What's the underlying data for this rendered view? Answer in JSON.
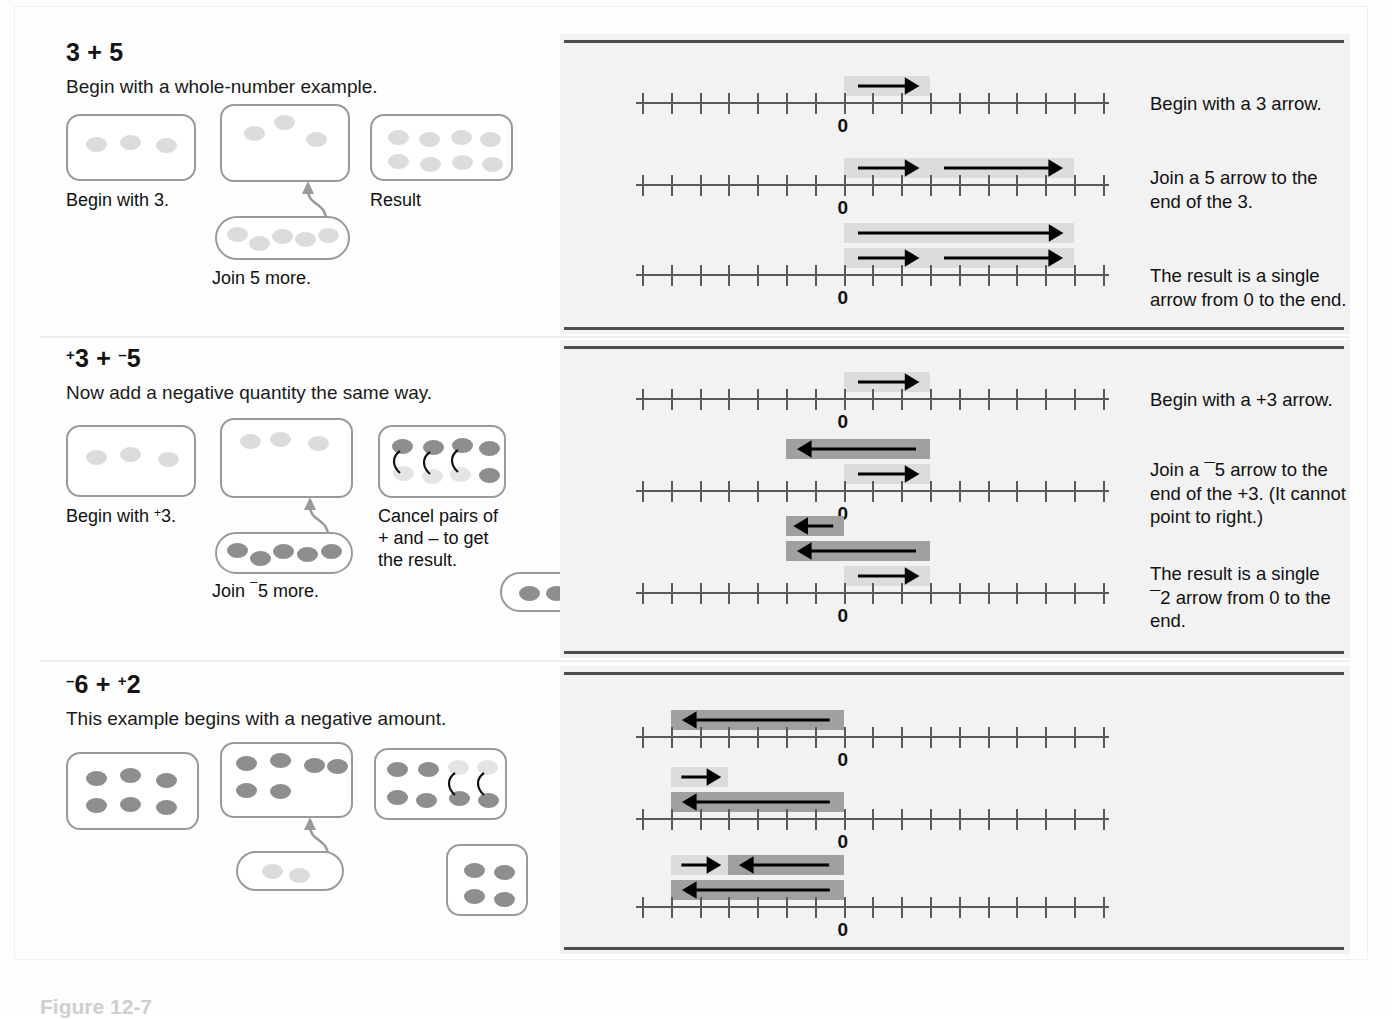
{
  "figure": {
    "caption": "Figure 12-7"
  },
  "panels": [
    {
      "id": "panel-whole-number",
      "equation_plain": "3 + 5",
      "equation_parts": [
        {
          "text": "3",
          "sign": ""
        },
        {
          "text": " + ",
          "sign": ""
        },
        {
          "text": "5",
          "sign": ""
        }
      ],
      "subtitle": "Begin with a whole-number example.",
      "dot_captions": {
        "begin": "Begin with 3.",
        "join": "Join 5 more.",
        "result": "Result"
      },
      "dot_counts": {
        "begin": 3,
        "join": 5,
        "result": 8
      },
      "lines": [
        {
          "note": "Begin with a 3 arrow.",
          "bars": [
            {
              "from": 0,
              "to": 3,
              "shade": "light",
              "dir": "right"
            }
          ]
        },
        {
          "note": "Join a 5 arrow to the\nend of the 3.",
          "bars": [
            {
              "from": 0,
              "to": 3,
              "shade": "light",
              "dir": "right"
            },
            {
              "from": 3,
              "to": 8,
              "shade": "light",
              "dir": "right"
            }
          ]
        },
        {
          "note": "The result is a single\narrow from 0 to the end.",
          "bars": [
            {
              "from": 0,
              "to": 8,
              "shade": "light",
              "dir": "right",
              "row": 0
            },
            {
              "from": 0,
              "to": 3,
              "shade": "light",
              "dir": "right",
              "row": 1
            },
            {
              "from": 3,
              "to": 8,
              "shade": "light",
              "dir": "right",
              "row": 1
            }
          ]
        }
      ],
      "zero_label": "0"
    },
    {
      "id": "panel-add-negative",
      "equation_plain": "+3 + -5",
      "subtitle": "Now add a negative quantity the same way.",
      "dot_captions": {
        "begin": "Begin with +3.",
        "join": "Join ¯5 more.",
        "result": "Cancel pairs of\n+ and – to get\nthe result."
      },
      "dot_counts": {
        "begin": 3,
        "join": 5,
        "result_pos": 3,
        "result_neg": 5,
        "final": 2
      },
      "lines": [
        {
          "note": "Begin with a +3 arrow.",
          "bars": [
            {
              "from": 0,
              "to": 3,
              "shade": "light",
              "dir": "right"
            }
          ]
        },
        {
          "note": "Join a ¯5 arrow to the\nend of  the +3. (It cannot\npoint to right.)",
          "bars": [
            {
              "from": 3,
              "to": -2,
              "shade": "dark",
              "dir": "left",
              "row": 0
            },
            {
              "from": 0,
              "to": 3,
              "shade": "light",
              "dir": "right",
              "row": 1
            }
          ]
        },
        {
          "note": "The result is a single\n¯2 arrow from 0 to the\nend.",
          "bars": [
            {
              "from": 0,
              "to": -2,
              "shade": "dark",
              "dir": "left",
              "row": 0
            },
            {
              "from": 3,
              "to": -2,
              "shade": "dark",
              "dir": "left",
              "row": 1
            },
            {
              "from": 0,
              "to": 3,
              "shade": "light",
              "dir": "right",
              "row": 2
            }
          ]
        }
      ],
      "zero_label": "0"
    },
    {
      "id": "panel-negative-start",
      "equation_plain": "-6 + +2",
      "subtitle": "This example begins with a negative amount.",
      "dot_captions": {},
      "dot_counts": {
        "begin": 6,
        "join": 2,
        "result_neg": 6,
        "result_pos": 2,
        "final": 4
      },
      "lines": [
        {
          "note": "",
          "bars": [
            {
              "from": 0,
              "to": -6,
              "shade": "dark",
              "dir": "left"
            }
          ]
        },
        {
          "note": "",
          "bars": [
            {
              "from": -6,
              "to": -4,
              "shade": "light",
              "dir": "right",
              "row": 0
            },
            {
              "from": 0,
              "to": -6,
              "shade": "dark",
              "dir": "left",
              "row": 1
            }
          ]
        },
        {
          "note": "",
          "bars": [
            {
              "from": -6,
              "to": -4,
              "shade": "light",
              "dir": "right",
              "row": 0
            },
            {
              "from": 0,
              "to": -4,
              "shade": "dark",
              "dir": "left",
              "row": 0
            },
            {
              "from": 0,
              "to": -6,
              "shade": "dark",
              "dir": "left",
              "row": 1
            }
          ]
        }
      ],
      "zero_label": "0"
    }
  ],
  "numberline": {
    "tick_count": 17,
    "zero_index": 7,
    "min": -7,
    "max": 9
  },
  "colors": {
    "bar_light": "#dcdcdc",
    "bar_dark": "#a0a0a0",
    "dot_positive": "#dcdcdc",
    "dot_negative": "#8e8e8e",
    "box_border": "#9a9a9a",
    "rule": "#4d4d4d",
    "panel_bg": "#f2f2f2"
  }
}
